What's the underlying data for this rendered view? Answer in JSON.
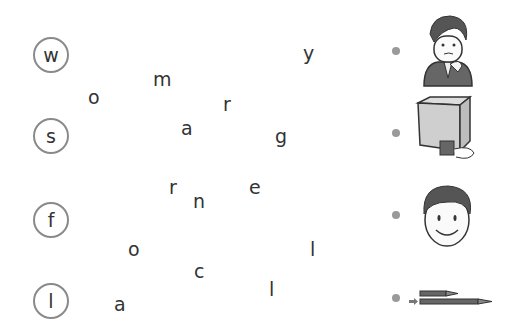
{
  "exercise": {
    "rows": [
      {
        "start_letter": "w",
        "picture": "worried-man"
      },
      {
        "start_letter": "s",
        "picture": "small-box-and-large-box"
      },
      {
        "start_letter": "f",
        "picture": "boy-face"
      },
      {
        "start_letter": "l",
        "picture": "short-and-long-pencils"
      }
    ],
    "scattered_letters": [
      {
        "char": "o",
        "x": 88,
        "y": 88
      },
      {
        "char": "m",
        "x": 153,
        "y": 70
      },
      {
        "char": "y",
        "x": 303,
        "y": 44
      },
      {
        "char": "r",
        "x": 223,
        "y": 95
      },
      {
        "char": "a",
        "x": 181,
        "y": 119
      },
      {
        "char": "g",
        "x": 275,
        "y": 127
      },
      {
        "char": "r",
        "x": 169,
        "y": 178
      },
      {
        "char": "n",
        "x": 193,
        "y": 192
      },
      {
        "char": "e",
        "x": 249,
        "y": 178
      },
      {
        "char": "o",
        "x": 128,
        "y": 240
      },
      {
        "char": "l",
        "x": 310,
        "y": 240
      },
      {
        "char": "c",
        "x": 194,
        "y": 262
      },
      {
        "char": "l",
        "x": 269,
        "y": 280
      },
      {
        "char": "a",
        "x": 114,
        "y": 295
      }
    ]
  },
  "colors": {
    "circle_border": "#8a8a8a",
    "dot": "#9a9a9a",
    "text": "#333333"
  }
}
